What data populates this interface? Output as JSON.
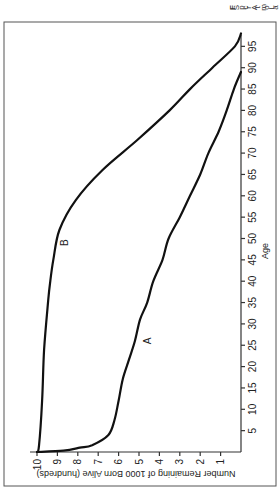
{
  "chart_data": {
    "type": "line",
    "title": "",
    "xlabel": "Age",
    "ylabel": "Number Remaining of 1000 Born Alive (hundreds)",
    "xlim": [
      0,
      98
    ],
    "ylim": [
      0,
      10.5
    ],
    "x_ticks": [
      5,
      10,
      15,
      20,
      25,
      30,
      35,
      40,
      45,
      50,
      55,
      60,
      65,
      70,
      75,
      80,
      85,
      90,
      95
    ],
    "y_ticks": [
      1,
      2,
      3,
      4,
      5,
      6,
      7,
      8,
      9,
      10
    ],
    "grid": false,
    "orientation_note": "figure rendered rotated 90 degrees counter-clockwise",
    "series": [
      {
        "name": "A",
        "x": [
          0,
          0.3,
          1,
          1.6,
          4,
          7.5,
          12,
          17,
          21.5,
          26,
          31,
          35,
          40,
          45,
          50,
          55,
          60,
          65,
          70,
          75,
          80,
          85,
          89
        ],
        "y": [
          10,
          8.7,
          7.9,
          7.3,
          6.5,
          6.2,
          6.0,
          5.8,
          5.5,
          5.2,
          4.95,
          4.6,
          4.3,
          3.85,
          3.55,
          3.0,
          2.5,
          2.0,
          1.6,
          1.1,
          0.7,
          0.35,
          0
        ]
      },
      {
        "name": "B",
        "x": [
          0,
          1.5,
          12,
          24,
          35.5,
          40,
          45,
          52,
          59,
          66,
          73,
          80,
          85,
          90,
          95,
          98
        ],
        "y": [
          10,
          9.9,
          9.75,
          9.65,
          9.45,
          9.35,
          9.2,
          8.9,
          8.1,
          6.8,
          5.1,
          3.5,
          2.5,
          1.4,
          0.3,
          0
        ]
      }
    ],
    "annotations": [
      {
        "text": "A",
        "x": 26,
        "y": 4.4
      },
      {
        "text": "B",
        "x": 49,
        "y": 8.5
      }
    ]
  },
  "caption_fragment": [
    "F",
    "S",
    "p",
    "c",
    "r",
    "A",
    "t",
    "m",
    "o",
    "L",
    "a"
  ]
}
